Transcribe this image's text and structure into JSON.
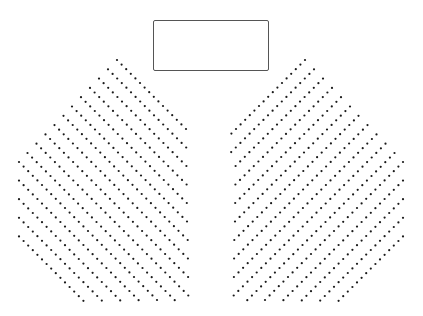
{
  "canvas": {
    "width": 423,
    "height": 316,
    "background": "#ffffff"
  },
  "stage": {
    "label": "",
    "x": 153,
    "y": 20,
    "width": 116,
    "height": 51,
    "border_color": "#555555"
  },
  "seat_style": {
    "color": "#1a1a1a",
    "radius": 1.1
  },
  "sections": [
    {
      "name": "left-seating-section",
      "direction": "down-right",
      "step": [
        4.6,
        4.6
      ],
      "bounds": {
        "x_min": 18,
        "x_max": 190,
        "y_max": 302
      },
      "row_starts": [
        [
          117,
          60
        ],
        [
          108,
          69.3
        ],
        [
          99,
          78.6
        ],
        [
          90,
          87.9
        ],
        [
          81,
          97.2
        ],
        [
          72,
          106.5
        ],
        [
          63.5,
          115.8
        ],
        [
          54.5,
          125.1
        ],
        [
          45.5,
          134.4
        ],
        [
          36.5,
          143.7
        ],
        [
          27.5,
          153
        ],
        [
          19,
          162
        ],
        [
          19,
          180.6
        ],
        [
          19,
          199.2
        ],
        [
          19,
          217.8
        ],
        [
          19,
          236.4
        ]
      ]
    },
    {
      "name": "right-seating-section",
      "direction": "down-left",
      "step": [
        -4.6,
        4.6
      ],
      "bounds": {
        "x_min": 231,
        "x_max": 405,
        "y_max": 302
      },
      "row_starts": [
        [
          305,
          60
        ],
        [
          314,
          69.3
        ],
        [
          323,
          78.6
        ],
        [
          332,
          87.9
        ],
        [
          341,
          97.2
        ],
        [
          350,
          106.5
        ],
        [
          358.5,
          115.8
        ],
        [
          367.5,
          125.1
        ],
        [
          376.5,
          134.4
        ],
        [
          385.5,
          143.7
        ],
        [
          394.5,
          153
        ],
        [
          403,
          162
        ],
        [
          403,
          180.6
        ],
        [
          403,
          199.2
        ],
        [
          403,
          217.8
        ],
        [
          403,
          236.4
        ]
      ]
    }
  ]
}
